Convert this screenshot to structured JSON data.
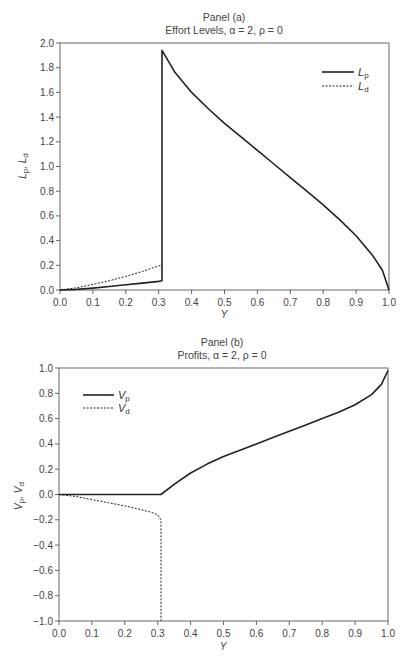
{
  "chart_data": [
    {
      "type": "line",
      "panel_label": "Panel (a)",
      "title": "Effort Levels, α = 2, ρ = 0",
      "xlabel": "Y",
      "ylabel": "Lp, Ld",
      "xlim": [
        0.0,
        1.0
      ],
      "ylim": [
        0.0,
        2.0
      ],
      "xticks": [
        "0.0",
        "0.1",
        "0.2",
        "0.3",
        "0.4",
        "0.5",
        "0.6",
        "0.7",
        "0.8",
        "0.9",
        "1.0"
      ],
      "yticks": [
        "0.0",
        "0.2",
        "0.4",
        "0.6",
        "0.8",
        "1.0",
        "1.2",
        "1.4",
        "1.6",
        "1.8",
        "2.0"
      ],
      "grid": false,
      "legend_position": "upper right",
      "series": [
        {
          "name": "Lp",
          "style": "solid",
          "x": [
            0.0,
            0.05,
            0.1,
            0.15,
            0.2,
            0.25,
            0.3,
            0.31,
            0.31,
            0.35,
            0.4,
            0.45,
            0.5,
            0.55,
            0.6,
            0.65,
            0.7,
            0.75,
            0.8,
            0.85,
            0.9,
            0.95,
            0.98,
            1.0
          ],
          "y": [
            0.0,
            0.005,
            0.015,
            0.028,
            0.042,
            0.056,
            0.07,
            0.075,
            1.94,
            1.76,
            1.6,
            1.47,
            1.35,
            1.24,
            1.13,
            1.02,
            0.91,
            0.8,
            0.69,
            0.57,
            0.44,
            0.28,
            0.16,
            0.0
          ]
        },
        {
          "name": "Ld",
          "style": "dashed",
          "x": [
            0.0,
            0.05,
            0.1,
            0.15,
            0.2,
            0.25,
            0.3,
            0.31
          ],
          "y": [
            0.0,
            0.018,
            0.045,
            0.075,
            0.11,
            0.15,
            0.195,
            0.2
          ]
        }
      ]
    },
    {
      "type": "line",
      "panel_label": "Panel (b)",
      "title": "Profits, α = 2, ρ = 0",
      "xlabel": "Y",
      "ylabel": "Vp, Vd",
      "xlim": [
        0.0,
        1.0
      ],
      "ylim": [
        -1.0,
        1.0
      ],
      "xticks": [
        "0.0",
        "0.1",
        "0.2",
        "0.3",
        "0.4",
        "0.5",
        "0.6",
        "0.7",
        "0.8",
        "0.9",
        "1.0"
      ],
      "yticks": [
        "-1.0",
        "-0.8",
        "-0.6",
        "-0.4",
        "-0.2",
        "0.0",
        "0.2",
        "0.4",
        "0.6",
        "0.8",
        "1.0"
      ],
      "grid": false,
      "legend_position": "upper left",
      "series": [
        {
          "name": "Vp",
          "style": "solid",
          "x": [
            0.0,
            0.1,
            0.2,
            0.3,
            0.31,
            0.35,
            0.4,
            0.45,
            0.5,
            0.55,
            0.6,
            0.65,
            0.7,
            0.75,
            0.8,
            0.85,
            0.9,
            0.95,
            0.98,
            1.0
          ],
          "y": [
            0.0,
            0.0,
            0.0,
            0.0,
            0.0,
            0.08,
            0.17,
            0.24,
            0.3,
            0.35,
            0.4,
            0.45,
            0.5,
            0.55,
            0.6,
            0.65,
            0.71,
            0.79,
            0.87,
            0.98
          ]
        },
        {
          "name": "Vd",
          "style": "dashed",
          "x": [
            0.0,
            0.05,
            0.1,
            0.15,
            0.2,
            0.25,
            0.28,
            0.3,
            0.31,
            0.31
          ],
          "y": [
            0.0,
            -0.015,
            -0.04,
            -0.065,
            -0.09,
            -0.12,
            -0.14,
            -0.16,
            -0.2,
            -1.0
          ]
        }
      ]
    }
  ]
}
